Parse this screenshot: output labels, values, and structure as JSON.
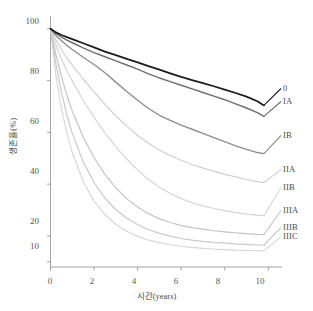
{
  "chart_data": {
    "type": "line",
    "title": "",
    "subtitle": "",
    "xlabel": "시간(years)",
    "ylabel": "생존율(%)",
    "xlim": [
      0,
      10.4
    ],
    "ylim": [
      8,
      103
    ],
    "xticks": [
      "0",
      "2",
      "4",
      "6",
      "8",
      "10"
    ],
    "xtick_values": [
      0,
      2,
      4,
      6,
      8,
      10
    ],
    "yticks": [
      "100",
      "80",
      "60",
      "40",
      "20",
      "10"
    ],
    "ytick_values": [
      100,
      80,
      60,
      40,
      20,
      10
    ],
    "grid": false,
    "legend_position": "right-of-curve-ends",
    "x": [
      0,
      0.25,
      0.5,
      0.75,
      1,
      1.5,
      2,
      2.5,
      3,
      3.5,
      4,
      4.5,
      5,
      5.5,
      6,
      6.5,
      7,
      7.5,
      8,
      8.5,
      9,
      9.5,
      9.8
    ],
    "series": [
      {
        "name": "0",
        "label": "0",
        "color": "#1c1c1c",
        "width": 1.8,
        "values": [
          100,
          98.6,
          97.6,
          96.8,
          96.0,
          94.4,
          92.8,
          91.2,
          89.8,
          88.4,
          87.0,
          85.6,
          84.2,
          82.8,
          81.4,
          80.2,
          79.0,
          77.8,
          76.5,
          75.2,
          73.8,
          72.0,
          70.4
        ]
      },
      {
        "name": "IA",
        "label": "IA",
        "color": "#6e6e6e",
        "width": 1.4,
        "values": [
          100,
          98.2,
          96.8,
          95.6,
          94.6,
          92.6,
          90.8,
          89.2,
          87.6,
          86.0,
          84.4,
          82.6,
          81.0,
          79.6,
          78.2,
          76.8,
          75.4,
          74.0,
          72.6,
          71.0,
          69.4,
          67.6,
          66.2
        ]
      },
      {
        "name": "IB",
        "label": "IB",
        "color": "#8e8e8e",
        "width": 1.4,
        "values": [
          100,
          97.4,
          95.4,
          93.6,
          92.0,
          89.0,
          86.2,
          83.0,
          79.4,
          75.8,
          72.4,
          69.2,
          66.6,
          64.6,
          62.8,
          61.2,
          59.6,
          58.0,
          56.4,
          54.8,
          53.4,
          52.2,
          51.8
        ]
      },
      {
        "name": "IIA",
        "label": "IIA",
        "color": "#cfcfcf",
        "width": 1.2,
        "values": [
          100,
          95.6,
          92.0,
          88.8,
          86.0,
          80.6,
          75.6,
          70.8,
          66.4,
          62.4,
          58.8,
          55.8,
          53.2,
          51.0,
          49.2,
          47.6,
          46.2,
          45.0,
          43.8,
          42.8,
          41.8,
          41.0,
          40.6
        ]
      },
      {
        "name": "IIB",
        "label": "IIB",
        "color": "#d5d5d5",
        "width": 1.2,
        "values": [
          100,
          93.6,
          88.4,
          83.8,
          79.8,
          72.4,
          65.8,
          59.8,
          54.4,
          49.6,
          45.4,
          41.8,
          38.8,
          36.4,
          34.4,
          32.8,
          31.6,
          30.6,
          29.8,
          29.0,
          28.4,
          28.0,
          27.8
        ]
      },
      {
        "name": "IIIA",
        "label": "IIIA",
        "color": "#c4c4c4",
        "width": 1.2,
        "values": [
          100,
          90.0,
          81.6,
          74.4,
          68.2,
          58.2,
          50.2,
          43.8,
          38.6,
          34.4,
          31.2,
          28.6,
          26.6,
          25.2,
          24.0,
          23.2,
          22.6,
          22.0,
          21.6,
          21.2,
          20.9,
          20.6,
          20.5
        ]
      },
      {
        "name": "IIIB",
        "label": "IIIB",
        "color": "#c9c9c9",
        "width": 1.2,
        "values": [
          100,
          86.4,
          75.6,
          66.8,
          59.6,
          48.6,
          40.6,
          34.6,
          30.2,
          26.8,
          24.4,
          22.4,
          21.0,
          19.9,
          19.0,
          18.4,
          17.9,
          17.5,
          17.2,
          16.9,
          16.7,
          16.5,
          16.4
        ]
      },
      {
        "name": "IIIC",
        "label": "IIIC",
        "color": "#d8d8d8",
        "width": 1.2,
        "values": [
          100,
          82.0,
          69.4,
          59.8,
          52.2,
          41.0,
          33.4,
          28.2,
          24.4,
          21.8,
          19.8,
          18.4,
          17.4,
          16.6,
          16.0,
          15.6,
          15.2,
          14.9,
          14.7,
          14.5,
          14.4,
          14.3,
          14.2
        ]
      }
    ],
    "axis_color": "#9a9a9a",
    "background": "#ffffff"
  }
}
